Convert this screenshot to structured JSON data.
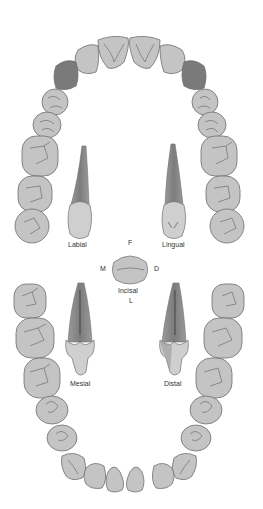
{
  "diagram": {
    "colors": {
      "tooth_fill": "#c4c4c4",
      "tooth_stroke": "#6e6e6e",
      "canine_highlight": "#7a7a7a",
      "root_fill": "#8c8c8c",
      "root_dark": "#6a6a6a",
      "crown_fill": "#cfcfcf"
    },
    "labels": {
      "labial": "Labial",
      "lingual": "Lingual",
      "incisal": "Incisal",
      "mesial": "Mesial",
      "distal": "Distal",
      "facial_dir": "F",
      "lingual_dir": "L",
      "mesial_dir": "M",
      "distal_dir": "D"
    },
    "arches": {
      "maxillary": {
        "tooth_count": 16,
        "highlighted": [
          "upper-right-canine",
          "upper-left-canine"
        ]
      },
      "mandibular": {
        "tooth_count": 16
      }
    }
  }
}
